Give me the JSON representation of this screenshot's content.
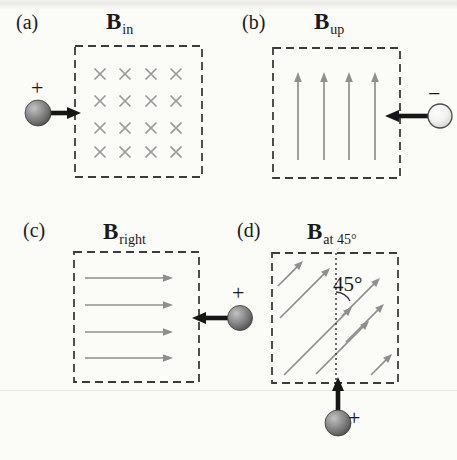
{
  "colors": {
    "background": "#fbfbf8",
    "field_gray": "#8f8f8f",
    "cross_gray": "#9a9a9a",
    "dash_border": "#3c3c3c",
    "velocity_black": "#161616",
    "dotted_line": "#3a3a3a"
  },
  "figure": {
    "panels": [
      {
        "letter": "(a)",
        "title": {
          "symbol": "B",
          "subscript": "in"
        },
        "field_pattern_icon": "crosses-into-page",
        "charge": {
          "sign": "+",
          "sphere_icon": "positive-charge-sphere"
        },
        "velocity_icon": "velocity-arrow-right-icon"
      },
      {
        "letter": "(b)",
        "title": {
          "symbol": "B",
          "subscript": "up"
        },
        "field_pattern_icon": "arrows-up",
        "charge": {
          "sign": "−",
          "sphere_icon": "negative-charge-sphere"
        },
        "velocity_icon": "velocity-arrow-left-icon"
      },
      {
        "letter": "(c)",
        "title": {
          "symbol": "B",
          "subscript": "right"
        },
        "field_pattern_icon": "arrows-right",
        "charge": {
          "sign": "+",
          "sphere_icon": "positive-charge-sphere"
        },
        "velocity_icon": "velocity-arrow-left-icon"
      },
      {
        "letter": "(d)",
        "title": {
          "symbol": "B",
          "subscript": "at 45°"
        },
        "field_pattern_icon": "arrows-45deg",
        "charge": {
          "sign": "+",
          "sphere_icon": "positive-charge-sphere"
        },
        "velocity_icon": "velocity-arrow-up-icon",
        "angle_label": "45°"
      }
    ]
  }
}
